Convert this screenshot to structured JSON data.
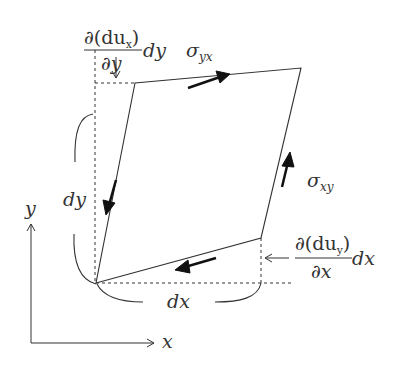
{
  "figure": {
    "type": "shear-deformation-element",
    "labels": {
      "top_frac_num": "∂(du",
      "top_frac_num_sub": "x",
      "top_frac_num_close": ")",
      "top_frac_den": "∂y",
      "top_frac_tail": "dy",
      "sigma_yx": "σ",
      "sigma_yx_sub": "yx",
      "sigma_xy": "σ",
      "sigma_xy_sub": "xy",
      "right_frac_num": "∂(du",
      "right_frac_num_sub": "y",
      "right_frac_num_close": ")",
      "right_frac_den": "∂x",
      "right_frac_tail": "dx",
      "dy_label": "dy",
      "dx_label": "dx",
      "axis_y": "y",
      "axis_x": "x"
    },
    "colors": {
      "line": "#333333",
      "background": "#ffffff"
    }
  }
}
